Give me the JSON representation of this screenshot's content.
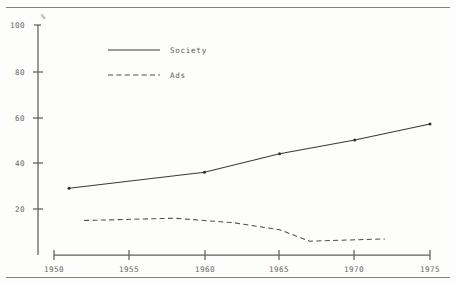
{
  "chart_data": {
    "type": "line",
    "title": "",
    "xlabel": "",
    "ylabel": "%",
    "ylim": [
      0,
      100
    ],
    "xlim": [
      1950,
      1975
    ],
    "grid": false,
    "legend_position": "top-center",
    "yticks": [
      20,
      40,
      60,
      80,
      100
    ],
    "xticks": [
      1950,
      1955,
      1960,
      1965,
      1970,
      1975
    ],
    "series": [
      {
        "name": "Society",
        "style": "solid",
        "x": [
          1951,
          1960,
          1965,
          1970,
          1975
        ],
        "values": [
          29,
          36,
          44,
          50,
          57
        ]
      },
      {
        "name": "Ads",
        "style": "dashed",
        "x": [
          1952,
          1958,
          1962,
          1965,
          1967,
          1972
        ],
        "values": [
          15,
          16,
          14,
          11,
          6,
          7
        ]
      }
    ]
  },
  "axes": {
    "unit_label": "%",
    "y_tick_labels": [
      "100",
      "80",
      "60",
      "40",
      "20"
    ],
    "x_tick_labels": [
      "1950",
      "1955",
      "1960",
      "1965",
      "1970",
      "1975"
    ]
  },
  "legend": {
    "entries": [
      {
        "label": "Society"
      },
      {
        "label": "Ads"
      }
    ]
  },
  "colors": {
    "society_line": "#3a3a3a",
    "ads_line": "#4d4d4d",
    "axis": "#5f5f5f",
    "text": "#656565",
    "rule": "#6d6d6d",
    "background": "#fdfdfc"
  }
}
